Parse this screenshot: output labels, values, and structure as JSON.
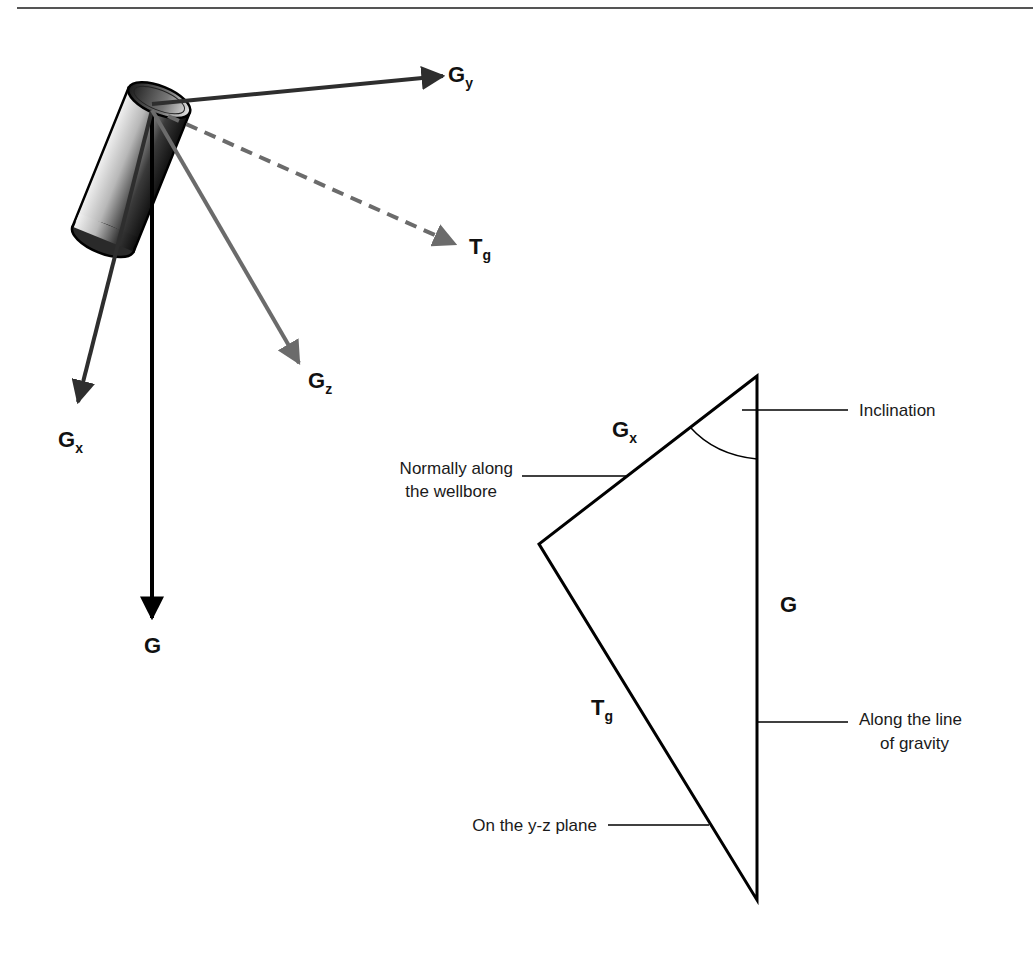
{
  "vectors_3d": {
    "gy": {
      "main": "G",
      "sub": "y"
    },
    "tg": {
      "main": "T",
      "sub": "g"
    },
    "gz": {
      "main": "G",
      "sub": "z"
    },
    "gx": {
      "main": "G",
      "sub": "x"
    },
    "g": {
      "main": "G"
    }
  },
  "triangle": {
    "gx": {
      "main": "G",
      "sub": "x"
    },
    "g": {
      "main": "G"
    },
    "tg": {
      "main": "T",
      "sub": "g"
    },
    "callouts": {
      "inclination": "Inclination",
      "wellbore_line1": "Normally along",
      "wellbore_line2": "the wellbore",
      "gravity_line1": "Along the line",
      "gravity_line2": "of gravity",
      "yz_plane": "On the y-z plane"
    }
  },
  "colors": {
    "dark_vector": "#2e2e2e",
    "gray_vector": "#6b6b6b",
    "black": "#000000",
    "rule": "#555555"
  }
}
